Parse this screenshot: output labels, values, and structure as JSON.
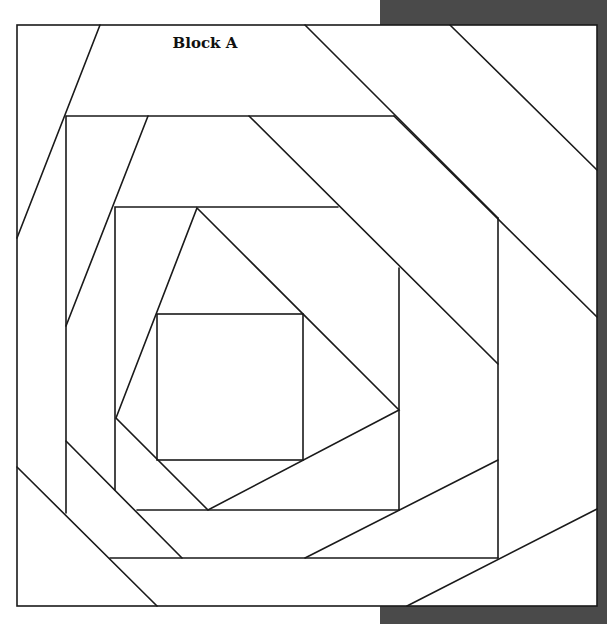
{
  "diagram": {
    "title": "Block A",
    "colors": {
      "line": "#1a1a1a",
      "fabric": "#ffffff",
      "shadow": "#4a4a4a"
    },
    "frame": {
      "x1": 17,
      "y1": 25,
      "x2": 597,
      "y2": 606
    },
    "pattern": "pineapple log cabin quilt block",
    "pieces": {
      "inner_square": {
        "x1": 157,
        "y1": 314,
        "x2": 303,
        "y2": 460
      },
      "ring_2_rect": {
        "x1": 115,
        "y1": 207,
        "x2": 399,
        "y2": 510
      },
      "ring_1_rect": {
        "x1": 66,
        "y1": 116,
        "x2": 498,
        "y2": 558
      }
    }
  }
}
